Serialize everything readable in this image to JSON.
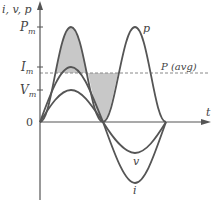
{
  "diagram": {
    "axes": {
      "y_label": "i, v, p",
      "x_label": "t",
      "origin_label": "0"
    },
    "y_ticks": [
      {
        "label": "P",
        "sub": "m"
      },
      {
        "label": "I",
        "sub": "m"
      },
      {
        "label": "V",
        "sub": "m"
      }
    ],
    "curves": {
      "power": "p",
      "voltage": "v",
      "current": "i"
    },
    "average_line_label": "P (avg)",
    "colors": {
      "curve": "#555555",
      "axis": "#555555",
      "shade": "#c8c8c8",
      "dashed": "#888888"
    }
  }
}
